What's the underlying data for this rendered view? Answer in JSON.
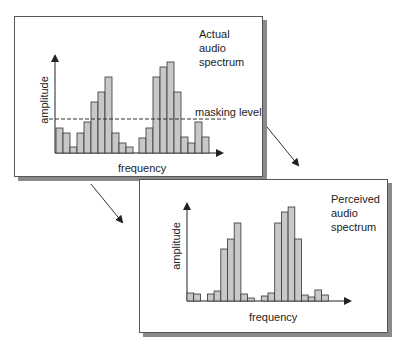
{
  "top_panel": {
    "title_lines": [
      "Actual",
      "audio",
      "spectrum"
    ],
    "y_label": "amplitude",
    "x_label": "frequency",
    "masking_label": "masking level"
  },
  "bottom_panel": {
    "title_lines": [
      "Perceived",
      "audio",
      "spectrum"
    ],
    "y_label": "amplitude",
    "x_label": "frequency"
  },
  "colors": {
    "bar_fill": "#c8c8c8",
    "bar_stroke": "#333333",
    "border": "#555555",
    "shadow": "#8a8a8a"
  },
  "chart_data": [
    {
      "type": "bar",
      "title": "Actual audio spectrum",
      "xlabel": "frequency",
      "ylabel": "amplitude",
      "annotations": [
        "masking level"
      ],
      "masking_level": 34,
      "values": [
        25,
        20,
        6,
        20,
        31,
        51,
        61,
        76,
        20,
        10,
        6,
        null,
        15,
        25,
        76,
        86,
        91,
        61,
        16,
        10,
        31,
        16
      ]
    },
    {
      "type": "bar",
      "title": "Perceived audio spectrum",
      "xlabel": "frequency",
      "ylabel": "amplitude",
      "values": [
        8,
        7,
        null,
        7,
        10,
        52,
        62,
        78,
        7,
        3,
        null,
        5,
        8,
        78,
        89,
        94,
        62,
        6,
        4,
        11,
        6
      ]
    }
  ]
}
